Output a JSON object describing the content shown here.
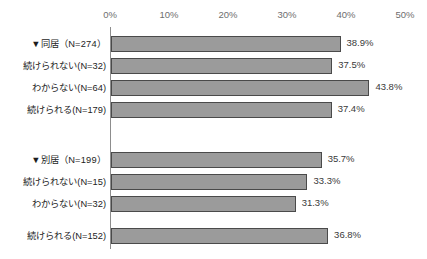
{
  "chart_data": {
    "type": "bar",
    "orientation": "horizontal",
    "title": "",
    "xlabel": "",
    "ylabel": "",
    "xlim": [
      0,
      50
    ],
    "grid": false,
    "legend": null,
    "xticks": [
      "0%",
      "10%",
      "20%",
      "30%",
      "40%",
      "50%"
    ],
    "xtick_values": [
      0,
      10,
      20,
      30,
      40,
      50
    ],
    "categories": [
      "▼同居（N=274）",
      "続けられない(N=32)",
      "わからない(N=64)",
      "続けられる(N=179)",
      "▼別居（N=199）",
      "続けられない(N=15)",
      "わからない(N=32)",
      "続けられる(N=152)"
    ],
    "values": [
      38.9,
      37.5,
      43.8,
      37.4,
      35.7,
      33.3,
      31.3,
      36.8
    ],
    "value_labels": [
      "38.9%",
      "37.5%",
      "43.8%",
      "37.4%",
      "35.7%",
      "33.3%",
      "31.3%",
      "36.8%"
    ],
    "bar_color": "#9b9b9b",
    "bar_border_color": "#4a4a4a",
    "axis_color": "#8d8d8d",
    "groups": [
      {
        "header": "▼同居（N=274）",
        "n": 274,
        "rows": [
          {
            "label": "続けられない(N=32)",
            "value": 37.5,
            "n": 32
          },
          {
            "label": "わからない(N=64)",
            "value": 43.8,
            "n": 64
          },
          {
            "label": "続けられる(N=179)",
            "value": 37.4,
            "n": 179
          }
        ]
      },
      {
        "header": "▼別居（N=199）",
        "n": 199,
        "rows": [
          {
            "label": "続けられない(N=15)",
            "value": 33.3,
            "n": 15
          },
          {
            "label": "わからない(N=32)",
            "value": 31.3,
            "n": 32
          },
          {
            "label": "続けられる(N=152)",
            "value": 36.8,
            "n": 152
          }
        ]
      }
    ]
  },
  "layout": {
    "rows_y": [
      36,
      58,
      80,
      102,
      152,
      174,
      196,
      228
    ],
    "plot_left": 110,
    "plot_top": 27,
    "px_per_percent": 5.9
  }
}
